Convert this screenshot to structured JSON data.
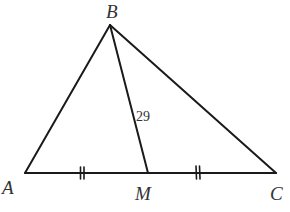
{
  "diagram": {
    "type": "triangle-with-median",
    "vertices": {
      "A": {
        "label": "A",
        "x": 25,
        "y": 173
      },
      "B": {
        "label": "B",
        "x": 110,
        "y": 25
      },
      "C": {
        "label": "C",
        "x": 276,
        "y": 173
      },
      "M": {
        "label": "M",
        "x": 148,
        "y": 173
      }
    },
    "segments": [
      "AB",
      "BC",
      "AC",
      "BM"
    ],
    "median_label": "29",
    "equal_marks": [
      "AM",
      "MC"
    ],
    "stroke_color": "#1a1a1a"
  }
}
